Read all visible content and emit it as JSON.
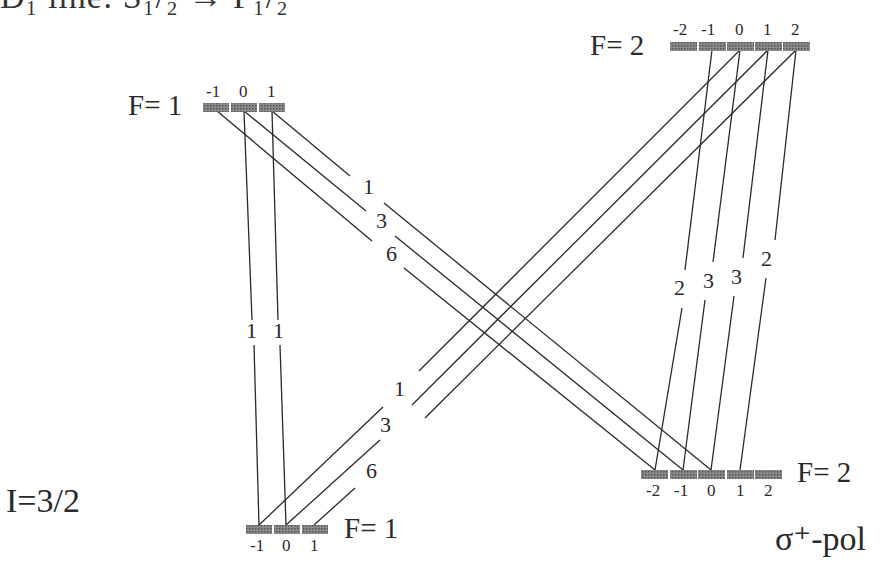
{
  "title_partial": "D₁ line: S₁/₂ → P₁/₂",
  "nuclear_spin": "I=3/2",
  "polarization": "σ⁺-pol",
  "colors": {
    "level_bar": "#6e6e6e",
    "line": "#2a2a2a",
    "background": "#ffffff"
  },
  "levels": {
    "upper_F1": {
      "label": "F= 1",
      "m": [
        "-1",
        "0",
        "1"
      ]
    },
    "upper_F2": {
      "label": "F= 2",
      "m": [
        "-2",
        "-1",
        "0",
        "1",
        "2"
      ]
    },
    "lower_F1": {
      "label": "F= 1",
      "m": [
        "-1",
        "0",
        "1"
      ]
    },
    "lower_F2": {
      "label": "F= 2",
      "m": [
        "-2",
        "-1",
        "0",
        "1",
        "2"
      ]
    }
  },
  "transitions": {
    "upperF1_to_lowerF1": [
      {
        "from_m": "0",
        "to_m": "-1",
        "strength": "1"
      },
      {
        "from_m": "1",
        "to_m": "0",
        "strength": "1"
      }
    ],
    "upperF1_to_lowerF2": [
      {
        "from_m": "1",
        "to_m": "0",
        "strength": "1"
      },
      {
        "from_m": "0",
        "to_m": "-1",
        "strength": "3"
      },
      {
        "from_m": "-1",
        "to_m": "-2",
        "strength": "6"
      }
    ],
    "upperF2_to_lowerF2": [
      {
        "from_m": "-1",
        "to_m": "-2",
        "strength": "2"
      },
      {
        "from_m": "0",
        "to_m": "-1",
        "strength": "3"
      },
      {
        "from_m": "1",
        "to_m": "0",
        "strength": "3"
      },
      {
        "from_m": "2",
        "to_m": "1",
        "strength": "2"
      }
    ],
    "upperF2_to_lowerF1": [
      {
        "from_m": "0",
        "to_m": "-1",
        "strength": "1"
      },
      {
        "from_m": "1",
        "to_m": "0",
        "strength": "3"
      },
      {
        "from_m": "2",
        "to_m": "1",
        "strength": "6"
      }
    ]
  }
}
